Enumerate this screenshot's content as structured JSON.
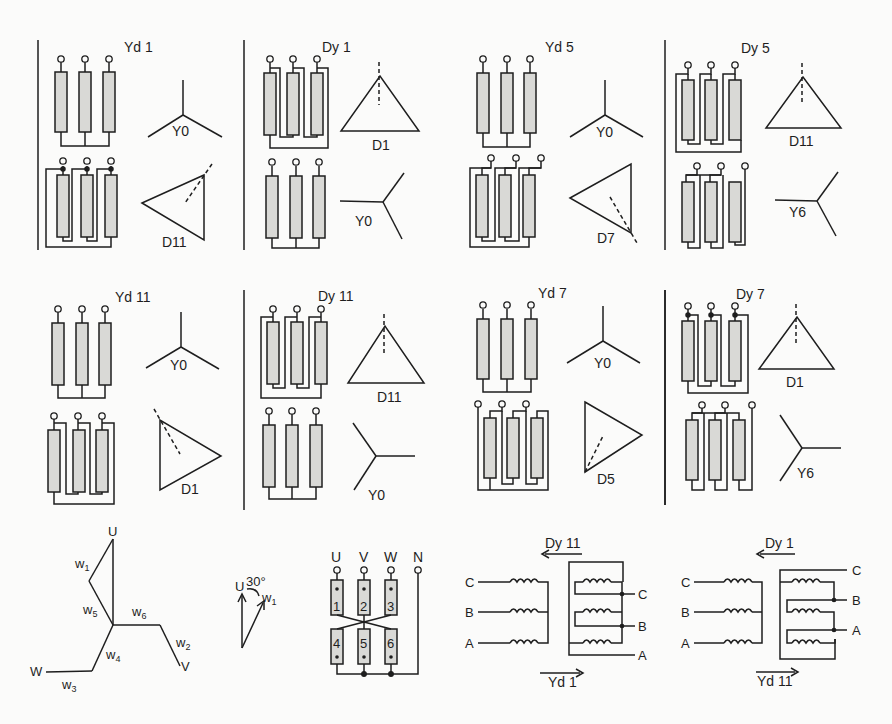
{
  "colors": {
    "background": "#fbfbfa",
    "line": "#1e1e1e",
    "winding_fill": "#d9d9d6"
  },
  "panels": [
    {
      "title": "Yd 1",
      "upper_label": "Y0",
      "lower_label": "D11"
    },
    {
      "title": "Dy 1",
      "upper_label": "D1",
      "lower_label": "Y0"
    },
    {
      "title": "Yd 5",
      "upper_label": "Y0",
      "lower_label": "D7"
    },
    {
      "title": "Dy 5",
      "upper_label": "D11",
      "lower_label": "Y6"
    },
    {
      "title": "Yd 11",
      "upper_label": "Y0",
      "lower_label": "D1"
    },
    {
      "title": "Dy 11",
      "upper_label": "D11",
      "lower_label": "Y0"
    },
    {
      "title": "Yd 7",
      "upper_label": "Y0",
      "lower_label": "D5"
    },
    {
      "title": "Dy 7",
      "upper_label": "D1",
      "lower_label": "Y6"
    }
  ],
  "zigzag_phasor": {
    "nodes": {
      "u": "U",
      "v": "V",
      "w": "W"
    },
    "windings": [
      "w",
      "w",
      "w",
      "w",
      "w",
      "w"
    ],
    "winding_subs": [
      "1",
      "2",
      "3",
      "4",
      "5",
      "6"
    ]
  },
  "angle_phasor": {
    "u": "U",
    "angle": "30°",
    "w": "w",
    "w_sub": "1"
  },
  "zigzag_connection": {
    "terminals": [
      "U",
      "V",
      "W",
      "N"
    ],
    "coils": [
      "1",
      "2",
      "3",
      "4",
      "5",
      "6"
    ]
  },
  "equivalence_left": {
    "top_label": "Dy 11",
    "bottom_label": "Yd 1",
    "left_phases": [
      "C",
      "B",
      "A"
    ],
    "right_phases": [
      "C",
      "B",
      "A"
    ]
  },
  "equivalence_right": {
    "top_label": "Dy 1",
    "bottom_label": "Yd 11",
    "left_phases": [
      "C",
      "B",
      "A"
    ],
    "right_phases": [
      "C",
      "B",
      "A"
    ]
  }
}
